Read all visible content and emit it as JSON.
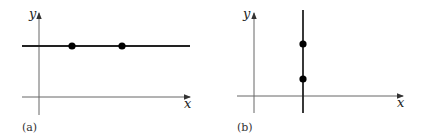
{
  "panels": [
    {
      "id": "a",
      "caption": "(a)",
      "x_label": "x",
      "y_label": "y",
      "line_orientation": "horizontal",
      "points_on_line": 2
    },
    {
      "id": "b",
      "caption": "(b)",
      "x_label": "x",
      "y_label": "y",
      "line_orientation": "vertical",
      "points_on_line": 2
    }
  ],
  "colors": {
    "axis": "#555555",
    "line": "#222222",
    "point": "#000000"
  }
}
